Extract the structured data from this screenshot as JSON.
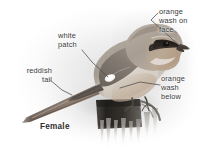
{
  "plate": {
    "subject": "shrike-female",
    "caption": "Female",
    "background_color": "#ffffff",
    "text_color": "#3a3a3a",
    "caption_color": "#2e2e2e",
    "leader_line_color": "#4a4a4a"
  },
  "annotations": [
    {
      "id": "orange-wash-on-face",
      "text": "orange\nwash on\nface",
      "anchor": "head-face",
      "position": "top-right"
    },
    {
      "id": "white-patch",
      "text": "white\npatch",
      "anchor": "wing-white-patch",
      "position": "upper-left"
    },
    {
      "id": "reddish-tail",
      "text": "reddish\ntail",
      "anchor": "tail",
      "position": "left"
    },
    {
      "id": "orange-wash-below",
      "text": "orange\nwash\nbelow",
      "anchor": "underparts-flank",
      "position": "right"
    }
  ],
  "bird": {
    "name": "shrike",
    "sex": "Female",
    "plumage_colors": {
      "crown_and_nape": "#a49a90",
      "mantle_back": "#9a9086",
      "face_wash": "#b5a493",
      "eye_mask": "#2b2622",
      "underparts": "#dcd6cf",
      "flank_wash": "#c4b4a2",
      "wing": "#8d857c",
      "wing_patch": "#f4f2ee",
      "tail": "#8a7a6c",
      "bill": "#4a4138",
      "eye": "#1b1714",
      "legs": "#55504a"
    }
  },
  "perch": {
    "id": "wooden-stump",
    "colors": {
      "post": "#2d2b28",
      "splinters": "#b9b5b0",
      "highlight": "#d8d5d1"
    }
  }
}
